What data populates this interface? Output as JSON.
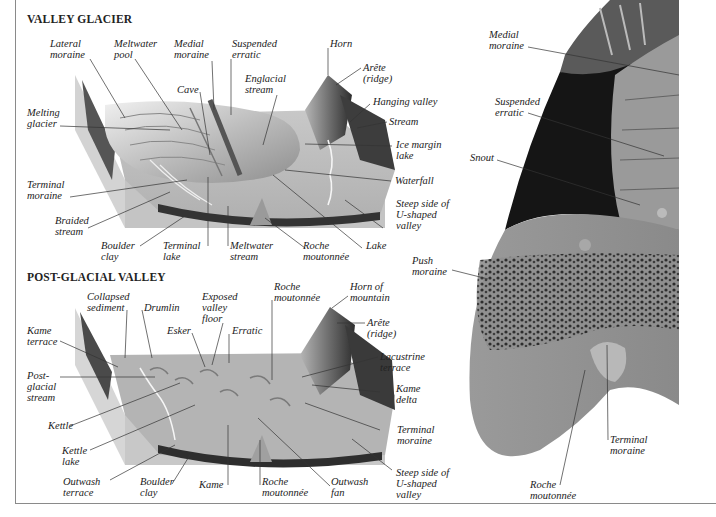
{
  "sections": {
    "valley_glacier": {
      "title": "VALLEY GLACIER",
      "labels": {
        "lateral_moraine": "Lateral\nmoraine",
        "meltwater_pool": "Meltwater\npool",
        "medial_moraine": "Medial\nmoraine",
        "suspended_erratic": "Suspended\nerratic",
        "horn": "Horn",
        "arete": "Arête\n(ridge)",
        "cave": "Cave",
        "englacial_stream": "Englacial\nstream",
        "hanging_valley": "Hanging valley",
        "stream": "Stream",
        "melting_glacier": "Melting\nglacier",
        "ice_margin_lake": "Ice margin\nlake",
        "waterfall": "Waterfall",
        "terminal_moraine": "Terminal\nmoraine",
        "steep_side": "Steep side of\nU-shaped\nvalley",
        "braided_stream": "Braided\nstream",
        "boulder_clay": "Boulder\nclay",
        "terminal_lake": "Terminal\nlake",
        "meltwater_stream": "Meltwater\nstream",
        "roche_moutonnee": "Roche\nmoutonnée",
        "lake": "Lake"
      }
    },
    "post_glacial_valley": {
      "title": "POST-GLACIAL VALLEY",
      "labels": {
        "collapsed_sediment": "Collapsed\nsediment",
        "drumlin": "Drumlin",
        "exposed_valley_floor": "Exposed\nvalley\nfloor",
        "roche_moutonnee_top": "Roche\nmoutonnée",
        "horn_of_mountain": "Horn of\nmountain",
        "kame_terrace": "Kame\nterrace",
        "esker": "Esker",
        "erratic": "Erratic",
        "arete": "Arête\n(ridge)",
        "post_glacial_stream": "Post-\nglacial\nstream",
        "lacustrine_terrace": "Lacustrine\nterrace",
        "kame_delta": "Kame\ndelta",
        "kettle": "Kettle",
        "terminal_moraine": "Terminal\nmoraine",
        "kettle_lake": "Kettle\nlake",
        "outwash_terrace": "Outwash\nterrace",
        "boulder_clay": "Boulder\nclay",
        "kame": "Kame",
        "roche_moutonnee_bottom": "Roche\nmoutonnée",
        "outwash_fan": "Outwash\nfan",
        "steep_side": "Steep side of\nU-shaped\nvalley"
      }
    },
    "glacier_snout": {
      "labels": {
        "medial_moraine": "Medial\nmoraine",
        "suspended_erratic": "Suspended\nerratic",
        "snout": "Snout",
        "push_moraine": "Push\nmoraine",
        "terminal_moraine": "Terminal\nmoraine",
        "roche_moutonnee": "Roche\nmoutonnée"
      }
    }
  },
  "colors": {
    "ink": "#222222",
    "border": "#8a8a8a",
    "ground_light": "#cfcfcf",
    "ground_mid": "#a8a8a8",
    "rock_dark": "#3a3a3a",
    "ice": "#e4e4e4"
  }
}
